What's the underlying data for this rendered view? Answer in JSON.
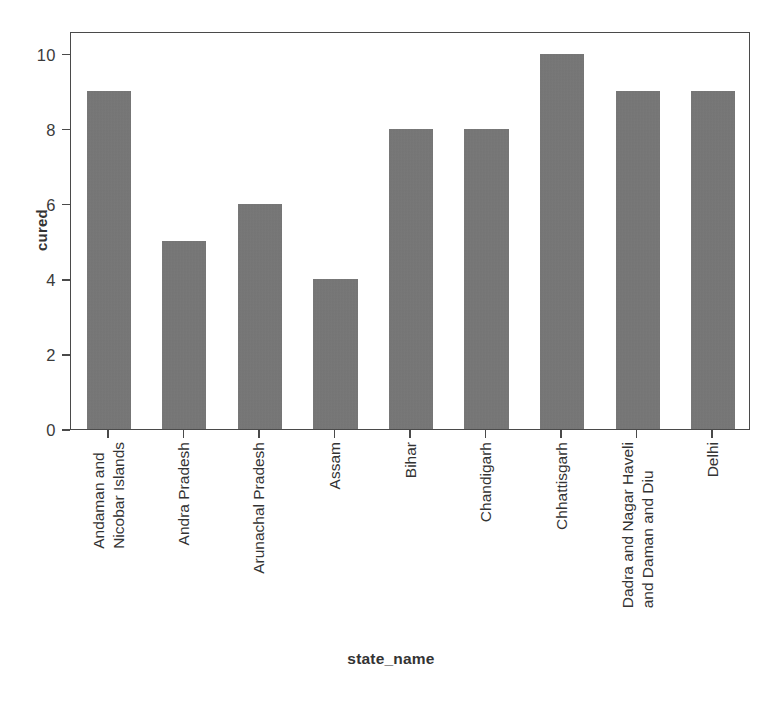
{
  "chart_data": {
    "type": "bar",
    "title": "",
    "xlabel": "state_name",
    "ylabel": "cured",
    "categories": [
      "Andaman and Nicobar Islands",
      "Andra Pradesh",
      "Arunachal Pradesh",
      "Assam",
      "Bihar",
      "Chandigarh",
      "Chhattisgarh",
      "Dadra and Nagar Haveli and Daman and Diu",
      "Delhi"
    ],
    "category_lines": [
      [
        "Andaman and",
        "Nicobar Islands"
      ],
      [
        "Andra Pradesh"
      ],
      [
        "Arunachal Pradesh"
      ],
      [
        "Assam"
      ],
      [
        "Bihar"
      ],
      [
        "Chandigarh"
      ],
      [
        "Chhattisgarh"
      ],
      [
        "Dadra and Nagar Haveli",
        "and Daman and Diu"
      ],
      [
        "Delhi"
      ]
    ],
    "values": [
      9,
      5,
      6,
      4,
      8,
      8,
      10,
      9,
      9
    ],
    "ylim": [
      0,
      10.6
    ],
    "yticks": [
      0,
      2,
      4,
      6,
      8,
      10
    ],
    "ytick_labels": [
      "0",
      "2",
      "4",
      "6",
      "8",
      "10"
    ],
    "grid": false,
    "legend": false,
    "bar_color": "#777777",
    "axis_color": "#4a4a4a",
    "background": "#ffffff"
  }
}
